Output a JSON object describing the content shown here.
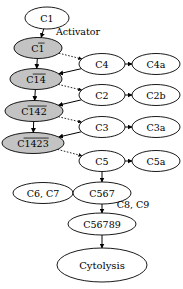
{
  "diagram": {
    "background_color": "#ffffff",
    "shaded_fill_color": "#c3c3c3",
    "node_fill_color": "#ffffff",
    "stroke_color": "#000000",
    "nodes": [
      {
        "id": "c1",
        "label": "C1",
        "overbar": "none",
        "shaded": false,
        "cx": 47,
        "cy": 18,
        "rx": 22,
        "ry": 11,
        "font_size": 9.5
      },
      {
        "id": "c1b",
        "label": "C1",
        "overbar": "1",
        "shaded": true,
        "cx": 38,
        "cy": 48,
        "rx": 24,
        "ry": 10.5,
        "font_size": 9.5
      },
      {
        "id": "c1b4",
        "label": "C14",
        "overbar": "14",
        "shaded": true,
        "cx": 36,
        "cy": 79,
        "rx": 26,
        "ry": 10.5,
        "font_size": 9.5
      },
      {
        "id": "c1b42",
        "label": "C142",
        "overbar": "142",
        "shaded": true,
        "cx": 34,
        "cy": 111,
        "rx": 29,
        "ry": 10.5,
        "font_size": 9.5
      },
      {
        "id": "c1b423",
        "label": "C1423",
        "overbar": "1423",
        "shaded": true,
        "cx": 33,
        "cy": 143,
        "rx": 31,
        "ry": 10.5,
        "font_size": 9.5
      },
      {
        "id": "c4",
        "label": "C4",
        "overbar": "none",
        "shaded": false,
        "cx": 102,
        "cy": 64,
        "rx": 23,
        "ry": 10.5,
        "font_size": 9.5
      },
      {
        "id": "c4a",
        "label": "C4a",
        "overbar": "none",
        "shaded": false,
        "cx": 156,
        "cy": 64,
        "rx": 24,
        "ry": 10.5,
        "font_size": 9.5
      },
      {
        "id": "c2",
        "label": "C2",
        "overbar": "none",
        "shaded": false,
        "cx": 102,
        "cy": 95,
        "rx": 23,
        "ry": 10.5,
        "font_size": 9.5
      },
      {
        "id": "c2b",
        "label": "C2b",
        "overbar": "none",
        "shaded": false,
        "cx": 156,
        "cy": 95,
        "rx": 24,
        "ry": 10.5,
        "font_size": 9.5
      },
      {
        "id": "c3",
        "label": "C3",
        "overbar": "none",
        "shaded": false,
        "cx": 102,
        "cy": 127,
        "rx": 23,
        "ry": 10.5,
        "font_size": 9.5
      },
      {
        "id": "c3a",
        "label": "C3a",
        "overbar": "none",
        "shaded": false,
        "cx": 156,
        "cy": 127,
        "rx": 24,
        "ry": 10.5,
        "font_size": 9.5
      },
      {
        "id": "c5",
        "label": "C5",
        "overbar": "none",
        "shaded": false,
        "cx": 102,
        "cy": 161,
        "rx": 23,
        "ry": 10.5,
        "font_size": 9.5
      },
      {
        "id": "c5a",
        "label": "C5a",
        "overbar": "none",
        "shaded": false,
        "cx": 156,
        "cy": 161,
        "rx": 24,
        "ry": 10.5,
        "font_size": 9.5
      },
      {
        "id": "c6c7",
        "label": "C6, C7",
        "overbar": "none",
        "shaded": false,
        "cx": 43,
        "cy": 193,
        "rx": 30,
        "ry": 10.5,
        "font_size": 9.5
      },
      {
        "id": "c567",
        "label": "C567",
        "overbar": "none",
        "shaded": false,
        "cx": 102,
        "cy": 193,
        "rx": 29,
        "ry": 11,
        "font_size": 9.5
      },
      {
        "id": "c56789",
        "label": "C56789",
        "overbar": "none",
        "shaded": false,
        "cx": 102,
        "cy": 224,
        "rx": 34,
        "ry": 11,
        "font_size": 9.5
      },
      {
        "id": "cytolysis",
        "label": "Cytolysis",
        "overbar": "none",
        "shaded": false,
        "cx": 102,
        "cy": 265,
        "rx": 45,
        "ry": 17,
        "font_size": 10
      }
    ],
    "edges": [
      {
        "id": "e-c1-c1b",
        "from": "c1",
        "to": "c1b",
        "style": "solid",
        "x1": 47,
        "y1": 29,
        "x2": 42,
        "y2": 37
      },
      {
        "id": "e-c1b-c4",
        "from": "c1b",
        "to": "c4",
        "style": "dotted",
        "x1": 60,
        "y1": 52,
        "x2": 80,
        "y2": 60
      },
      {
        "id": "e-c4-c1b4",
        "from": "c4",
        "to": "c1b4",
        "style": "solid",
        "x1": 80,
        "y1": 69,
        "x2": 61,
        "y2": 76
      },
      {
        "id": "e-c1b-c1b4",
        "from": "c1b",
        "to": "c1b4",
        "style": "solid",
        "x1": 40,
        "y1": 59,
        "x2": 39,
        "y2": 68
      },
      {
        "id": "e-c1b4-c2",
        "from": "c1b4",
        "to": "c2",
        "style": "dotted",
        "x1": 61,
        "y1": 84,
        "x2": 80,
        "y2": 91
      },
      {
        "id": "e-c2-c1b42",
        "from": "c2",
        "to": "c1b42",
        "style": "solid",
        "x1": 80,
        "y1": 100,
        "x2": 62,
        "y2": 108
      },
      {
        "id": "e-c1b4-c1b42",
        "from": "c1b4",
        "to": "c1b42",
        "style": "solid",
        "x1": 38,
        "y1": 90,
        "x2": 37,
        "y2": 100
      },
      {
        "id": "e-c1b42-c3",
        "from": "c1b42",
        "to": "c3",
        "style": "dotted",
        "x1": 63,
        "y1": 116,
        "x2": 80,
        "y2": 123
      },
      {
        "id": "e-c3-c1b423",
        "from": "c3",
        "to": "c1b423",
        "style": "solid",
        "x1": 80,
        "y1": 133,
        "x2": 64,
        "y2": 140
      },
      {
        "id": "e-c1b42-c1b423",
        "from": "c1b42",
        "to": "c1b423",
        "style": "solid",
        "x1": 35,
        "y1": 122,
        "x2": 35,
        "y2": 132
      },
      {
        "id": "e-c1b423-c5",
        "from": "c1b423",
        "to": "c5",
        "style": "dotted",
        "x1": 64,
        "y1": 149,
        "x2": 80,
        "y2": 157
      },
      {
        "id": "e-c4-c4a",
        "from": "c4",
        "to": "c4a",
        "style": "solid",
        "x1": 125,
        "y1": 64,
        "x2": 132,
        "y2": 64
      },
      {
        "id": "e-c2-c2b",
        "from": "c2",
        "to": "c2b",
        "style": "solid",
        "x1": 125,
        "y1": 95,
        "x2": 132,
        "y2": 95
      },
      {
        "id": "e-c3-c3a",
        "from": "c3",
        "to": "c3a",
        "style": "solid",
        "x1": 125,
        "y1": 127,
        "x2": 132,
        "y2": 127
      },
      {
        "id": "e-c5-c5a",
        "from": "c5",
        "to": "c5a",
        "style": "solid",
        "x1": 125,
        "y1": 161,
        "x2": 132,
        "y2": 161
      },
      {
        "id": "e-c5-c567",
        "from": "c5",
        "to": "c567",
        "style": "solid",
        "x1": 102,
        "y1": 172,
        "x2": 102,
        "y2": 182
      },
      {
        "id": "e-c6c7-c567",
        "from": "c6c7",
        "to": "c567",
        "style": "solid",
        "x1": 73,
        "y1": 193,
        "x2": 73,
        "y2": 193
      },
      {
        "id": "e-c567-c56789",
        "from": "c567",
        "to": "c56789",
        "style": "solid",
        "x1": 102,
        "y1": 204,
        "x2": 102,
        "y2": 213
      },
      {
        "id": "e-c56789-cytolysis",
        "from": "c56789",
        "to": "cytolysis",
        "style": "solid",
        "x1": 102,
        "y1": 235,
        "x2": 102,
        "y2": 248
      }
    ],
    "edge_labels": [
      {
        "id": "lbl-activator",
        "text": "Activator",
        "x": 78,
        "y": 31,
        "font_size": 9.5
      },
      {
        "id": "lbl-c8c9",
        "text": "C8, C9",
        "x": 133,
        "y": 204,
        "font_size": 9.5
      }
    ]
  }
}
